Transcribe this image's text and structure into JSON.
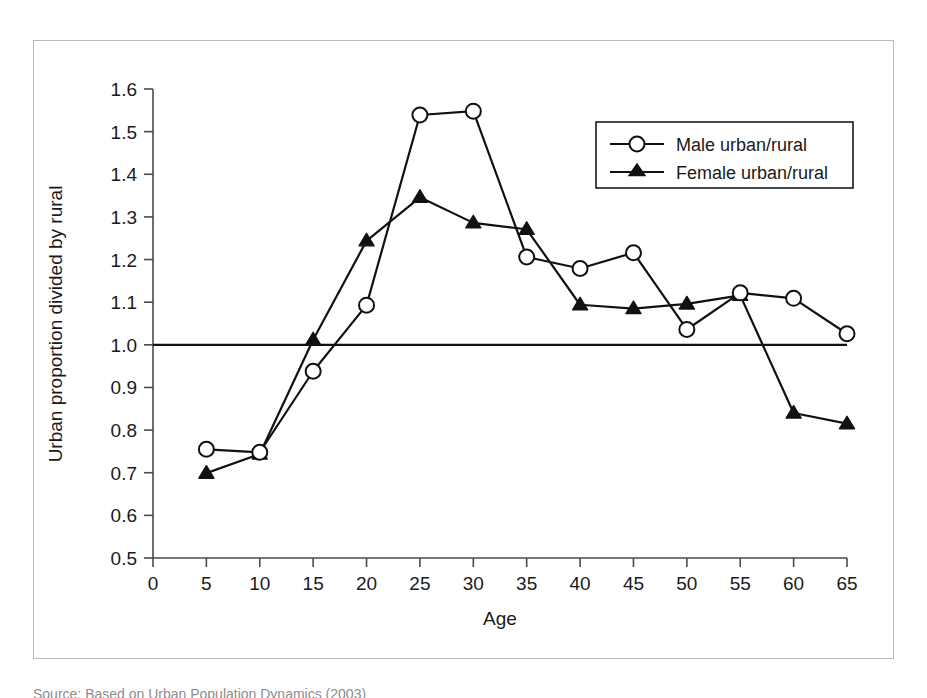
{
  "figure": {
    "caption": "Source: Based on Urban Population Dynamics (2003)"
  },
  "legend": {
    "entries": [
      {
        "label": "Male urban/rural",
        "marker": "open-circle-icon"
      },
      {
        "label": "Female urban/rural",
        "marker": "filled-triangle-icon"
      }
    ]
  },
  "axes": {
    "x_title": "Age",
    "y_title": "Urban proportion divided by rural",
    "x_ticks": [
      "0",
      "5",
      "10",
      "15",
      "20",
      "25",
      "30",
      "35",
      "40",
      "45",
      "50",
      "55",
      "60",
      "65"
    ],
    "y_ticks": [
      "0.5",
      "0.6",
      "0.7",
      "0.8",
      "0.9",
      "1.0",
      "1.1",
      "1.2",
      "1.3",
      "1.4",
      "1.5",
      "1.6"
    ]
  },
  "chart_data": {
    "type": "line",
    "title": "",
    "xlabel": "Age",
    "ylabel": "Urban proportion divided by rural",
    "x": [
      5,
      10,
      15,
      20,
      25,
      30,
      35,
      40,
      45,
      50,
      55,
      60,
      65
    ],
    "xlim": [
      0,
      65
    ],
    "ylim": [
      0.5,
      1.6
    ],
    "grid": false,
    "reference_line": {
      "y": 1.0,
      "label": "parity"
    },
    "legend_position": "top-right",
    "series": [
      {
        "name": "Male urban/rural",
        "marker": "open-circle",
        "values": [
          0.755,
          0.748,
          0.938,
          1.093,
          1.539,
          1.548,
          1.206,
          1.179,
          1.216,
          1.036,
          1.122,
          1.109,
          1.026
        ]
      },
      {
        "name": "Female urban/rural",
        "marker": "filled-triangle",
        "values": [
          0.699,
          0.744,
          1.012,
          1.244,
          1.346,
          1.286,
          1.271,
          1.094,
          1.085,
          1.096,
          1.116,
          0.84,
          0.815
        ]
      }
    ]
  }
}
